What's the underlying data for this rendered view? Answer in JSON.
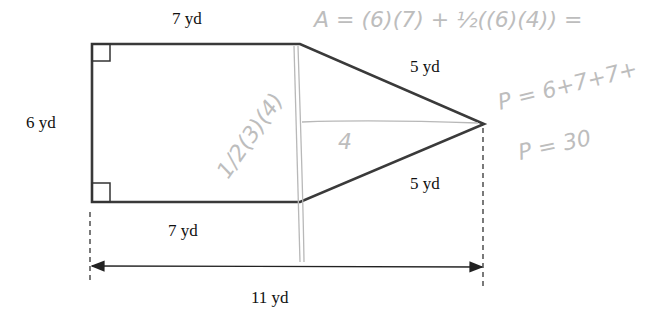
{
  "figure": {
    "shape": "rectangle joined with isosceles triangle (pentagon)",
    "labels": {
      "top": "7 yd",
      "left": "6 yd",
      "bottom": "7 yd",
      "upper_slant": "5 yd",
      "lower_slant": "5 yd",
      "total_width": "11 yd"
    },
    "right_angle_marks": 2
  },
  "handwriting": {
    "area_formula": "A = (6)(7) + ½((6)(4)) =",
    "perimeter_formula": "P = 6+7+7+",
    "perimeter_result": "P = 30",
    "triangle_note": "1/2(3)(4)",
    "height_note": "4"
  },
  "colors": {
    "ink": "#3a3a3a",
    "pencil": "#b8b8b8",
    "background": "#ffffff"
  }
}
